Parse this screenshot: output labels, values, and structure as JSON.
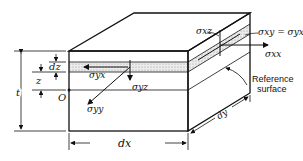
{
  "diagram": {
    "labels": {
      "dz": "dz",
      "z": "z",
      "t": "t",
      "origin": "O",
      "sigma_yx": "σyx",
      "sigma_yz": "σyz",
      "sigma_yy": "σyy",
      "sigma_xz": "σxz",
      "sigma_xy_eq": "σxy = σyx",
      "sigma_xx": "σxx",
      "reference_line1": "Reference",
      "reference_line2": "surface",
      "dx": "dx",
      "dy": "dy"
    },
    "colors": {
      "line": "#111111",
      "layer_fill": "#d8d8d8",
      "background": "#ffffff"
    }
  }
}
